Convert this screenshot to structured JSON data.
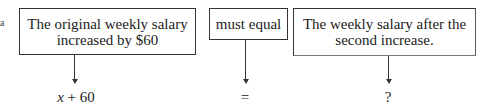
{
  "margin_mark": "a",
  "boxes": [
    {
      "text": "The original weekly salary increased by $60"
    },
    {
      "text": "must equal"
    },
    {
      "text": "The weekly salary after the second increase."
    }
  ],
  "expressions": [
    {
      "var": "x",
      "rest": " + 60"
    },
    {
      "text": "="
    },
    {
      "text": "?"
    }
  ]
}
